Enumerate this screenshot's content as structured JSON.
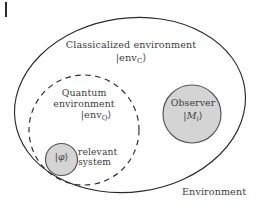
{
  "figure": {
    "colors": {
      "stroke": "#2b2b2b",
      "text": "#3c3c3c",
      "circle_fill": "#d4d4d4",
      "circle_stroke": "#555555",
      "background": "#ffffff"
    },
    "outer_region": {
      "name": "Environment",
      "label": "Environment",
      "style": "solid-ellipse"
    },
    "classicalized_region": {
      "label_line1": "Classicalized environment",
      "label_line2_prefix": "|env",
      "label_line2_sub": "C",
      "label_line2_suffix": "⟩"
    },
    "quantum_region": {
      "label_line1": "Quantum",
      "label_line2": "environment",
      "label_line3_prefix": "|env",
      "label_line3_sub": "Q",
      "label_line3_suffix": "⟩",
      "style": "dashed-circle"
    },
    "observer": {
      "label_line1": "Observer",
      "label_line2_prefix": "|",
      "label_line2_symbol": "M",
      "label_line2_sub": "i",
      "label_line2_suffix": "⟩",
      "style": "filled-circle"
    },
    "relevant_system": {
      "label_line1": "relevant",
      "label_line2": "system",
      "ket_prefix": "|",
      "ket_symbol": "φ",
      "ket_suffix": "⟩",
      "style": "filled-circle"
    },
    "corner_mark": {
      "name": "page-edge-mark"
    }
  }
}
